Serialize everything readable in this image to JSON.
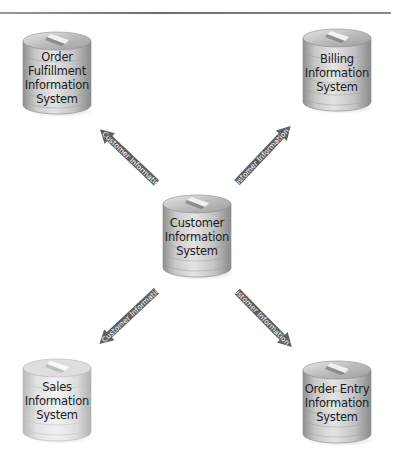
{
  "diagram": {
    "hub": {
      "id": "customer",
      "lines": [
        "Customer",
        "Information",
        "System"
      ]
    },
    "nodes": [
      {
        "id": "order-fulfillment",
        "position": "top-left",
        "lines": [
          "Order",
          "Fulfillment",
          "Information",
          "System"
        ]
      },
      {
        "id": "billing",
        "position": "top-right",
        "lines": [
          "Billing",
          "Information",
          "System"
        ]
      },
      {
        "id": "sales",
        "position": "bottom-left",
        "lines": [
          "Sales",
          "Information",
          "System"
        ]
      },
      {
        "id": "order-entry",
        "position": "bottom-right",
        "lines": [
          "Order Entry",
          "Information",
          "System"
        ]
      }
    ],
    "edges": [
      {
        "from": "customer",
        "to": "order-fulfillment",
        "label": "Customer Information"
      },
      {
        "from": "customer",
        "to": "billing",
        "label": "Customer Information"
      },
      {
        "from": "customer",
        "to": "sales",
        "label": "Customer Information"
      },
      {
        "from": "customer",
        "to": "order-entry",
        "label": "Customer Information"
      }
    ],
    "colors": {
      "arrow": "#5f5f5f",
      "cylinder_dark": "#8c8c8c",
      "cylinder_light": "#d6d6d6",
      "rule": "#7a7a7a"
    }
  }
}
